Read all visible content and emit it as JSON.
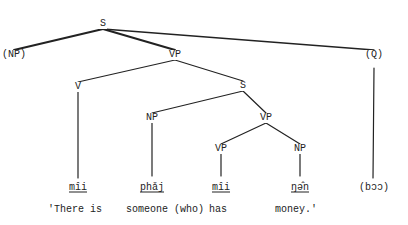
{
  "diagram": {
    "type": "syntax-tree",
    "nodes": [
      {
        "id": "s_root",
        "label": "S",
        "x": 103,
        "y": 24
      },
      {
        "id": "np_opt",
        "label": "(NP)",
        "x": 14,
        "y": 55
      },
      {
        "id": "vp_main",
        "label": "VP",
        "x": 175,
        "y": 55
      },
      {
        "id": "q_opt",
        "label": "(Q)",
        "x": 374,
        "y": 55
      },
      {
        "id": "v",
        "label": "V",
        "x": 78,
        "y": 87
      },
      {
        "id": "s_emb",
        "label": "S",
        "x": 243,
        "y": 86
      },
      {
        "id": "np_subj",
        "label": "NP",
        "x": 152,
        "y": 118
      },
      {
        "id": "vp_emb",
        "label": "VP",
        "x": 266,
        "y": 118
      },
      {
        "id": "vp_inner",
        "label": "VP",
        "x": 221,
        "y": 149
      },
      {
        "id": "np_obj",
        "label": "NP",
        "x": 300,
        "y": 149
      }
    ],
    "edges": [
      {
        "from": [
          103,
          29
        ],
        "to": [
          14,
          50
        ],
        "weight": 2
      },
      {
        "from": [
          103,
          29
        ],
        "to": [
          175,
          50
        ],
        "weight": 2
      },
      {
        "from": [
          103,
          29
        ],
        "to": [
          374,
          50
        ],
        "weight": 1.3
      },
      {
        "from": [
          175,
          60
        ],
        "to": [
          78,
          82
        ],
        "weight": 1.2
      },
      {
        "from": [
          175,
          60
        ],
        "to": [
          243,
          81
        ],
        "weight": 1.2
      },
      {
        "from": [
          78,
          92
        ],
        "to": [
          78,
          178
        ],
        "weight": 1.2
      },
      {
        "from": [
          243,
          91
        ],
        "to": [
          152,
          113
        ],
        "weight": 1.2
      },
      {
        "from": [
          243,
          91
        ],
        "to": [
          266,
          113
        ],
        "weight": 1.2
      },
      {
        "from": [
          152,
          123
        ],
        "to": [
          152,
          176
        ],
        "weight": 1.2
      },
      {
        "from": [
          266,
          123
        ],
        "to": [
          221,
          144
        ],
        "weight": 1.2
      },
      {
        "from": [
          266,
          123
        ],
        "to": [
          300,
          144
        ],
        "weight": 1.2
      },
      {
        "from": [
          221,
          154
        ],
        "to": [
          221,
          176
        ],
        "weight": 1.2
      },
      {
        "from": [
          300,
          154
        ],
        "to": [
          300,
          176
        ],
        "weight": 1.2
      },
      {
        "from": [
          374,
          68
        ],
        "to": [
          373,
          178
        ],
        "weight": 1.2
      }
    ],
    "leaves": [
      {
        "id": "leaf_mii_1",
        "text": "mîi",
        "x": 78,
        "y": 187,
        "underline": true
      },
      {
        "id": "leaf_phaj",
        "text": "phǎj",
        "x": 152,
        "y": 187,
        "underline": true
      },
      {
        "id": "leaf_mii_2",
        "text": "mîi",
        "x": 221,
        "y": 187,
        "underline": true
      },
      {
        "id": "leaf_ngen",
        "text": "ŋə̂n",
        "x": 300,
        "y": 187,
        "underline": true
      },
      {
        "id": "leaf_boo",
        "text": "(bɔɔ)",
        "x": 374,
        "y": 187,
        "underline": false
      }
    ],
    "gloss": [
      {
        "text": "'There is",
        "x": 48,
        "y": 209
      },
      {
        "text": "someone (who)",
        "x": 126,
        "y": 209
      },
      {
        "text": "has",
        "x": 209,
        "y": 209
      },
      {
        "text": "money.'",
        "x": 275,
        "y": 209
      }
    ],
    "line_color": "#222222"
  }
}
